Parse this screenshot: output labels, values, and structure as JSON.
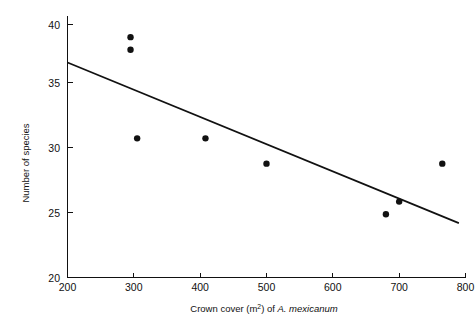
{
  "chart_data": {
    "type": "scatter",
    "title": "",
    "xlabel": "Crown cover (m2) of A. mexicanum",
    "xlabel_parts": {
      "prefix": "Crown cover (m",
      "superscript": "2",
      "middle": ") of ",
      "species": "A. mexicanum"
    },
    "ylabel": "Number of species",
    "xlim": [
      200,
      800
    ],
    "ylim": [
      20,
      40
    ],
    "xticks": [
      200,
      300,
      400,
      500,
      600,
      700,
      800
    ],
    "xtick_labels": [
      "200",
      "300",
      "400",
      "500",
      "600",
      "700",
      "800"
    ],
    "yticks": [
      20,
      25,
      30,
      35,
      40
    ],
    "ytick_labels": [
      "20",
      "25",
      "30",
      "35",
      "40"
    ],
    "grid": false,
    "legend": "none",
    "marker": "filled-circle",
    "marker_color": "#111111",
    "points": [
      {
        "x": 295,
        "y": 39
      },
      {
        "x": 295,
        "y": 38
      },
      {
        "x": 305,
        "y": 31
      },
      {
        "x": 408,
        "y": 31
      },
      {
        "x": 500,
        "y": 29
      },
      {
        "x": 680,
        "y": 25
      },
      {
        "x": 700,
        "y": 26
      },
      {
        "x": 765,
        "y": 29
      }
    ],
    "series": [
      {
        "name": "Number of species",
        "x": [
          295,
          295,
          305,
          408,
          500,
          680,
          700,
          765
        ],
        "values": [
          39,
          38,
          31,
          31,
          29,
          25,
          26,
          29
        ]
      }
    ],
    "fit_line": {
      "type": "linear-regression",
      "color": "#111111",
      "x_start": 200,
      "y_start": 37.0,
      "x_end": 790,
      "y_end": 24.3
    }
  },
  "figure": {
    "background_color": "#ffffff",
    "axis_color": "#111111"
  }
}
